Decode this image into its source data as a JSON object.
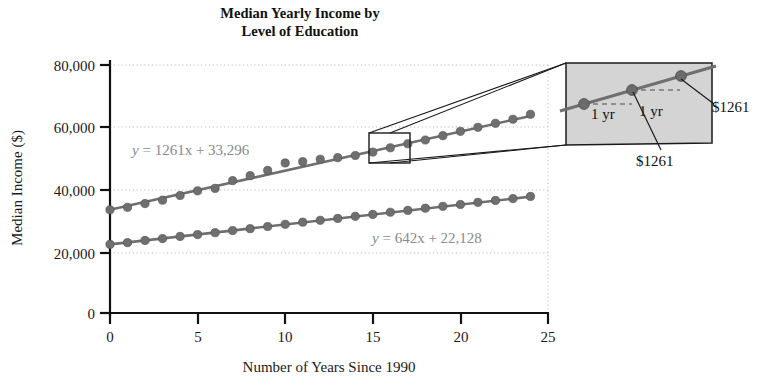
{
  "chart_data": {
    "type": "scatter",
    "title": "Median Yearly Income by Level of Education",
    "title_lines": [
      "Median Yearly Income by",
      "Level of Education"
    ],
    "xlabel": "Number of Years Since 1990",
    "ylabel": "Median Income ($)",
    "xlim": [
      0,
      25
    ],
    "ylim": [
      0,
      80000
    ],
    "xticks": [
      0,
      5,
      10,
      15,
      20,
      25
    ],
    "xtick_labels": [
      "0",
      "5",
      "10",
      "15",
      "20",
      "25"
    ],
    "yticks": [
      0,
      20000,
      40000,
      60000,
      80000
    ],
    "ytick_labels": [
      "0",
      "20,000",
      "40,000",
      "60,000",
      "80,000"
    ],
    "grid": "horizontal-dotted",
    "legend": "none",
    "series": [
      {
        "name": "Higher level of education",
        "equation": "y = 1261x + 33,296",
        "slope": 1261,
        "intercept": 33296,
        "color": "#6f6f6f",
        "x": [
          0,
          1,
          2,
          3,
          4,
          5,
          6,
          7,
          8,
          9,
          10,
          11,
          12,
          13,
          14,
          15,
          16,
          17,
          18,
          19,
          20,
          21,
          22,
          23,
          24
        ],
        "y": [
          33296,
          34100,
          35300,
          36400,
          37900,
          39400,
          40200,
          42700,
          44300,
          46000,
          48400,
          48800,
          49600,
          50100,
          50800,
          51900,
          53300,
          54600,
          55800,
          57200,
          58600,
          59900,
          61200,
          62500,
          64100
        ]
      },
      {
        "name": "Lower level of education",
        "equation": "y = 642x + 22,128",
        "slope": 642,
        "intercept": 22128,
        "color": "#6f6f6f",
        "x": [
          0,
          1,
          2,
          3,
          4,
          5,
          6,
          7,
          8,
          9,
          10,
          11,
          12,
          13,
          14,
          15,
          16,
          17,
          18,
          19,
          20,
          21,
          22,
          23,
          24
        ],
        "y": [
          22128,
          22700,
          23400,
          24000,
          24700,
          25300,
          25900,
          26600,
          27200,
          27900,
          28600,
          29300,
          29900,
          30500,
          31200,
          31800,
          32500,
          33100,
          33800,
          34400,
          35000,
          35700,
          36300,
          36900,
          37600
        ]
      }
    ],
    "annotations": {
      "equation_upper": "y = 1261x + 33,296",
      "equation_lower": "y = 642x + 22,128",
      "source_box": {
        "x0": 15,
        "x1": 17.1,
        "y0": 51200,
        "y1": 56800
      },
      "inset": {
        "fill": "#d4d4d4",
        "points": [
          {
            "label_run": "1 yr",
            "label_rise": "$1261"
          },
          {
            "label_run": "1 yr",
            "label_rise": "$1261"
          }
        ],
        "run_label_left": "1 yr",
        "run_label_right": "1 yr",
        "rise_label_lower": "$1261",
        "rise_label_right": "$1261"
      }
    }
  },
  "figure": {
    "title_line1": "Median Yearly Income by",
    "title_line2": "Level of Education",
    "x_axis_label": "Number of Years Since 1990",
    "y_axis_label": "Median Income ($)",
    "eq_upper_y": "y",
    "eq_upper_rest": " = 1261x + 33,296",
    "eq_lower_y": "y",
    "eq_lower_rest": " = 642x + 22,128",
    "inset_run_1": "1 yr",
    "inset_run_2": "1 yr",
    "inset_rise_1": "$1261",
    "inset_rise_2": "$1261",
    "ytick_0": "0",
    "ytick_20k": "20,000",
    "ytick_40k": "40,000",
    "ytick_60k": "60,000",
    "ytick_80k": "80,000",
    "xtick_0": "0",
    "xtick_5": "5",
    "xtick_10": "10",
    "xtick_15": "15",
    "xtick_20": "20",
    "xtick_25": "25"
  },
  "colors": {
    "series": "#6f6f6f",
    "marker": "#6b6b6b",
    "equation_text": "#8a8a8a",
    "axis": "#111111",
    "grid": "#b9b9b9",
    "inset_fill": "#d4d4d4",
    "inset_stroke": "#1a1a1a",
    "background": "#ffffff"
  }
}
